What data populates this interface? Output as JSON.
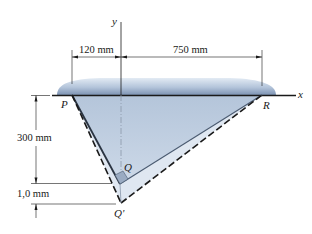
{
  "figure": {
    "axes": {
      "x_label": "x",
      "y_label": "y"
    },
    "points": {
      "P": "P",
      "Q": "Q",
      "R": "R",
      "Q_prime": "Q'"
    },
    "dimensions": {
      "left_offset": "120 mm",
      "right_offset": "750 mm",
      "height": "300 mm",
      "deflection": "1,0 mm"
    },
    "colors": {
      "plate_fill": "#b9c9dd",
      "plate_dark": "#6f86a8",
      "triangle_fill": "#c9d6e6",
      "deformed_fill": "#dde6f0",
      "line": "#1a1a1a",
      "edge": "#4a5a70"
    }
  }
}
